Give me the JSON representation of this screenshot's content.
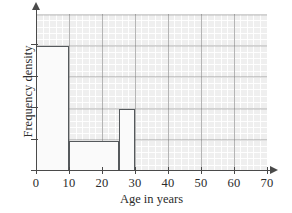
{
  "chart_data": {
    "type": "bar",
    "title": "",
    "subtitle": "",
    "xlabel": "Age in years",
    "ylabel": "Frequency density",
    "xlim": [
      0,
      70
    ],
    "ylim": [
      0,
      5
    ],
    "grid": true,
    "legend": null,
    "x_ticks": [
      {
        "value": 0,
        "label": "0"
      },
      {
        "value": 10,
        "label": "10"
      },
      {
        "value": 20,
        "label": "20"
      },
      {
        "value": 30,
        "label": "30"
      },
      {
        "value": 40,
        "label": "40"
      },
      {
        "value": 50,
        "label": "50"
      },
      {
        "value": 60,
        "label": "60"
      },
      {
        "value": 70,
        "label": "70"
      }
    ],
    "y_ticks": [
      {
        "value": 0,
        "label": ""
      },
      {
        "value": 1,
        "label": ""
      },
      {
        "value": 2,
        "label": ""
      },
      {
        "value": 3,
        "label": ""
      },
      {
        "value": 4,
        "label": ""
      }
    ],
    "bars": [
      {
        "name": "bar-0-10",
        "x_start": 0,
        "x_end": 10,
        "height": 4
      },
      {
        "name": "bar-10-25",
        "x_start": 10,
        "x_end": 25,
        "height": 1
      },
      {
        "name": "bar-25-30",
        "x_start": 25,
        "x_end": 30,
        "height": 2
      }
    ],
    "colors": {
      "bar_fill": "#fafafa",
      "bar_stroke": "#55595c",
      "grid_major": "#787878",
      "grid_minor": "#ffffff",
      "grid_background": "#efefef",
      "axis": "#4a4a4a",
      "text": "#2b2b2b"
    }
  }
}
